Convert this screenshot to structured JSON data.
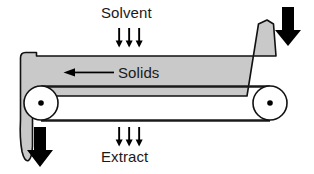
{
  "diagram": {
    "background_color": "#ffffff",
    "labels": {
      "solvent": "Solvent",
      "solids": "Solids",
      "extract": "Extract"
    },
    "colors": {
      "solids_bed_fill": "#c9c9c9",
      "solids_bed_stroke": "#111111",
      "belt_fill": "#ffffff",
      "belt_stroke": "#1a1a1a",
      "pulley_fill": "#ffffff",
      "pulley_stroke": "#111111",
      "pulley_hub": "#000000",
      "arrow_black": "#000000",
      "text": "#1a1a1a"
    },
    "elements": {
      "solvent_feed_arrows": {
        "name": "solvent-spray-arrows",
        "count": 3,
        "direction": "down"
      },
      "extract_drain_arrows": {
        "name": "extract-drain-arrows",
        "count": 3,
        "direction": "down"
      },
      "solids_flow_arrow": {
        "name": "solids-flow-arrow",
        "direction": "left"
      },
      "feed_inlet_arrow": {
        "name": "feed-inlet-arrow",
        "direction": "down",
        "position": "top-right"
      },
      "solids_discharge_arrow": {
        "name": "solids-discharge-arrow",
        "direction": "down",
        "position": "bottom-left"
      },
      "left_pulley": {
        "name": "left-pulley",
        "cx": 41,
        "cy": 103,
        "r": 17
      },
      "right_pulley": {
        "name": "right-pulley",
        "cx": 270,
        "cy": 103,
        "r": 17
      }
    }
  }
}
